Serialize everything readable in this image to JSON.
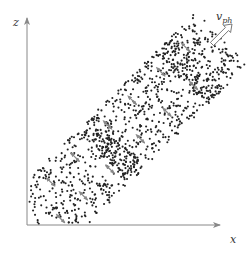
{
  "diagram": {
    "title": "",
    "axes": {
      "x_label": "x",
      "z_label": "z",
      "origin": [
        27,
        225
      ],
      "x_end": 220,
      "z_end": 18,
      "color": "#888888"
    },
    "velocity_label": {
      "main": "v",
      "subscript": "ph",
      "position": [
        225,
        22
      ]
    },
    "velocity_arrow": {
      "from": [
        212,
        44
      ],
      "to": [
        232,
        24
      ],
      "style": "hollow"
    },
    "band": {
      "direction_deg": 45,
      "start": [
        32,
        228
      ],
      "end": [
        222,
        38
      ],
      "half_width": 37,
      "dot_count": 900,
      "dot_color": "#222222",
      "dot_radius": 1.05,
      "dense_stripes": [
        0.42,
        0.83
      ],
      "stripe_width": 0.045
    },
    "small_arrows": {
      "color": "#888888",
      "length": 9,
      "rows": [
        {
          "offset": -18,
          "positions": [
            0.17,
            0.3,
            0.47,
            0.6,
            0.75,
            0.88
          ]
        },
        {
          "offset": 15,
          "positions": [
            0.1,
            0.22,
            0.36,
            0.52,
            0.66,
            0.8
          ]
        }
      ]
    }
  }
}
